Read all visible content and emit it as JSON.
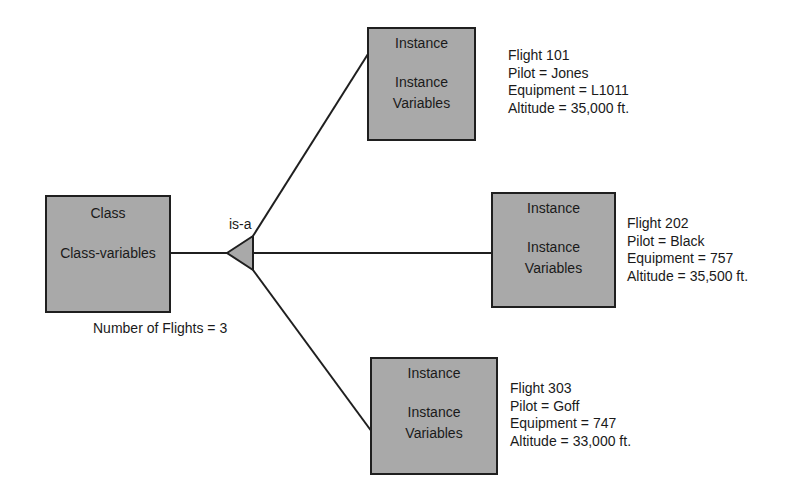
{
  "diagram": {
    "class_box": {
      "title": "Class",
      "vars": "Class-variables",
      "note": "Number of Flights = 3"
    },
    "relation_label": "is-a",
    "instances": [
      {
        "title": "Instance",
        "vars_line1": "Instance",
        "vars_line2": "Variables",
        "flight": "Flight 101",
        "pilot": "Pilot = Jones",
        "equipment": "Equipment = L1011",
        "altitude": "Altitude = 35,000 ft."
      },
      {
        "title": "Instance",
        "vars_line1": "Instance",
        "vars_line2": "Variables",
        "flight": "Flight 202",
        "pilot": "Pilot = Black",
        "equipment": "Equipment = 757",
        "altitude": "Altitude = 35,500 ft."
      },
      {
        "title": "Instance",
        "vars_line1": "Instance",
        "vars_line2": "Variables",
        "flight": "Flight 303",
        "pilot": "Pilot = Goff",
        "equipment": "Equipment = 747",
        "altitude": "Altitude = 33,000 ft."
      }
    ],
    "colors": {
      "box_fill": "#a9a9a9",
      "line": "#1f1f1f",
      "background": "#ffffff"
    }
  }
}
